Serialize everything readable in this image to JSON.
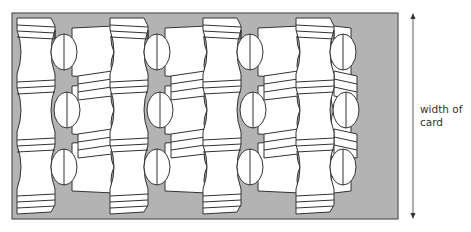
{
  "diagram": {
    "dimension_label": {
      "line1": "width of",
      "line2": "card"
    },
    "colors": {
      "card_fill": "#b3b3b3",
      "card_border": "#555555",
      "shape_fill": "#ffffff",
      "stroke": "#333333",
      "text": "#333333"
    },
    "pillar_columns_x": [
      17,
      110,
      203,
      296
    ],
    "oval_columns_x": [
      64,
      157,
      250,
      343
    ],
    "oval_rows_y": [
      52,
      110,
      167
    ],
    "card_bounds": {
      "x": 12,
      "y": 13,
      "width": 386,
      "height": 206
    },
    "arrow": {
      "x": 413,
      "y1": 14,
      "y2": 218
    }
  }
}
